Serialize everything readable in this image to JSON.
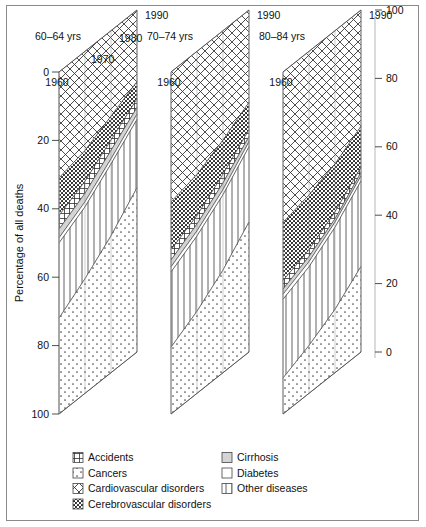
{
  "axes": {
    "y_left_title": "Percentage of all deaths",
    "y_left_ticks": [
      "0",
      "20",
      "40",
      "60",
      "80",
      "100"
    ],
    "y_right_ticks": [
      "100",
      "80",
      "60",
      "40",
      "20",
      "0"
    ],
    "x_ticks": [
      "1960",
      "1970",
      "1980",
      "1990"
    ]
  },
  "panels": [
    {
      "title": "60–64 yrs"
    },
    {
      "title": "70–74 yrs"
    },
    {
      "title": "80–84 yrs"
    }
  ],
  "legend": {
    "col1": [
      {
        "label": "Accidents",
        "pattern": "accidents-h",
        "icon": "swatch-accidents"
      },
      {
        "label": "Cancers",
        "pattern": "cancers-sparse-dots",
        "icon": "swatch-cancers"
      },
      {
        "label": "Cardiovascular disorders",
        "pattern": "cardio-crosshatch",
        "icon": "swatch-cardiovascular"
      },
      {
        "label": "Cerebrovascular disorders",
        "pattern": "cerebro-dense-dots",
        "icon": "swatch-cerebrovascular"
      }
    ],
    "col2": [
      {
        "label": "Cirrhosis",
        "pattern": "cirrhosis-gray",
        "icon": "swatch-cirrhosis"
      },
      {
        "label": "Diabetes",
        "pattern": "diabetes-blank",
        "icon": "swatch-diabetes"
      },
      {
        "label": "Other diseases",
        "pattern": "other-vertical",
        "icon": "swatch-other"
      }
    ]
  },
  "chart_data": {
    "type": "area",
    "title": "",
    "subtitle": "",
    "xlabel": "",
    "ylabel": "Percentage of all deaths",
    "ylim": [
      0,
      100
    ],
    "y_inverted": true,
    "grid": true,
    "legend_position": "bottom",
    "projection": "3d-stacked-area",
    "x": [
      1960,
      1970,
      1980,
      1990
    ],
    "panels": [
      {
        "name": "60–64 yrs",
        "series": [
          {
            "name": "Cardiovascular disorders",
            "values": [
              31,
              29,
              25,
              21
            ]
          },
          {
            "name": "Cerebrovascular disorders",
            "values": [
              11,
              9,
              7,
              5
            ]
          },
          {
            "name": "Accidents",
            "values": [
              4,
              3.5,
              3,
              2.5
            ]
          },
          {
            "name": "Cirrhosis",
            "values": [
              2.5,
              2.5,
              2.5,
              2
            ]
          },
          {
            "name": "Diabetes",
            "values": [
              1.5,
              1.5,
              1.5,
              1.5
            ]
          },
          {
            "name": "Other diseases",
            "values": [
              22,
              21,
              21,
              20
            ]
          },
          {
            "name": "Cancers",
            "values": [
              28,
              33.5,
              40,
              48
            ]
          }
        ]
      },
      {
        "name": "70–74 yrs",
        "series": [
          {
            "name": "Cardiovascular disorders",
            "values": [
              38,
              36,
              32,
              27
            ]
          },
          {
            "name": "Cerebrovascular disorders",
            "values": [
              14,
              12,
              10,
              8
            ]
          },
          {
            "name": "Accidents",
            "values": [
              3,
              2.5,
              2.5,
              2
            ]
          },
          {
            "name": "Cirrhosis",
            "values": [
              2,
              2,
              2,
              1.5
            ]
          },
          {
            "name": "Diabetes",
            "values": [
              1.5,
              1.5,
              1.5,
              1.5
            ]
          },
          {
            "name": "Other diseases",
            "values": [
              22,
              22,
              22,
              22
            ]
          },
          {
            "name": "Cancers",
            "values": [
              19.5,
              24,
              30,
              38
            ]
          }
        ]
      },
      {
        "name": "80–84 yrs",
        "series": [
          {
            "name": "Cardiovascular disorders",
            "values": [
              44,
              42,
              39,
              34
            ]
          },
          {
            "name": "Cerebrovascular disorders",
            "values": [
              17,
              16,
              14,
              12
            ]
          },
          {
            "name": "Accidents",
            "values": [
              2.5,
              2,
              2,
              1.5
            ]
          },
          {
            "name": "Cirrhosis",
            "values": [
              1.5,
              1.5,
              1,
              1
            ]
          },
          {
            "name": "Diabetes",
            "values": [
              1.5,
              1.5,
              1.5,
              1.5
            ]
          },
          {
            "name": "Other diseases",
            "values": [
              23,
              23,
              24,
              25
            ]
          },
          {
            "name": "Cancers",
            "values": [
              10.5,
              14,
              18.5,
              25
            ]
          }
        ]
      }
    ]
  }
}
